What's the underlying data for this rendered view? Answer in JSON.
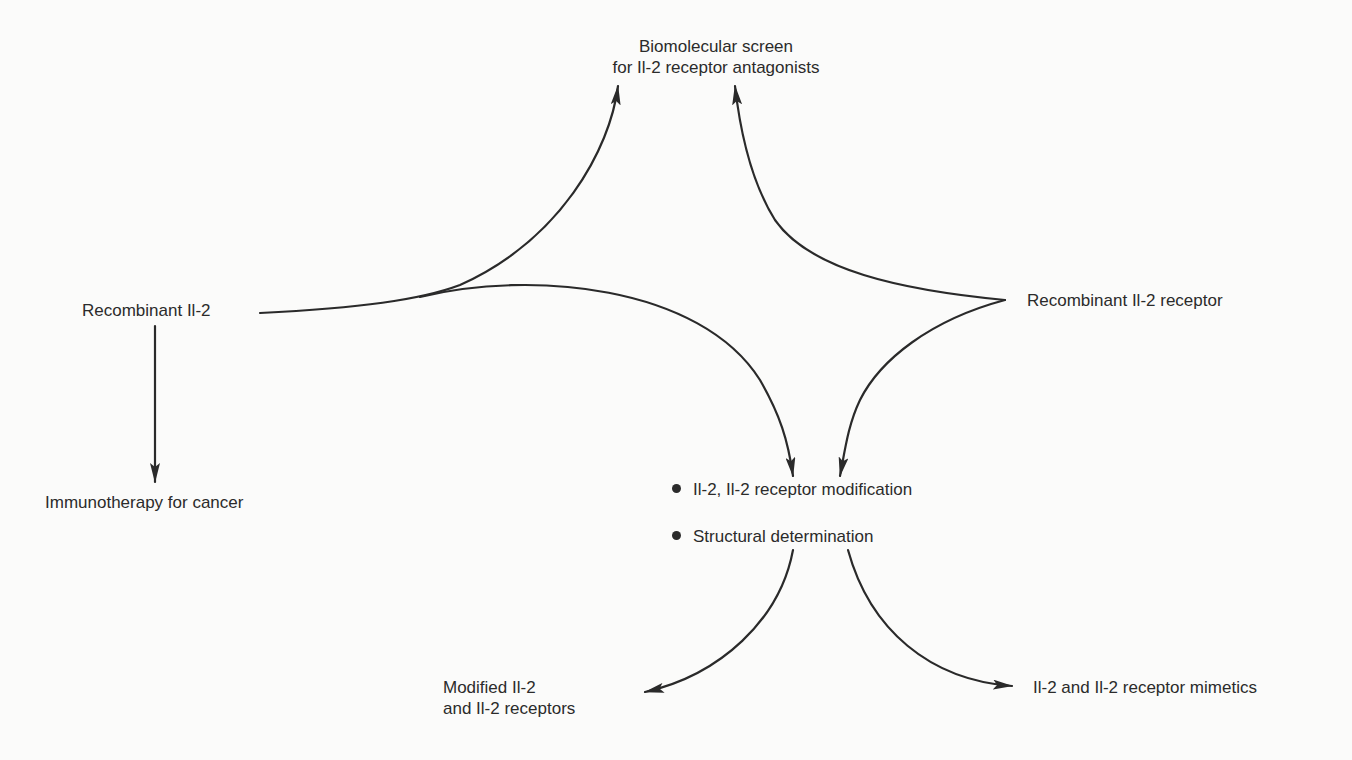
{
  "diagram": {
    "type": "flow-diagram",
    "stroke_color": "#2a2a2a",
    "background": "#fbfbfa",
    "nodes": {
      "biomolecular_screen": {
        "line1": "Biomolecular screen",
        "line2": "for Il-2 receptor antagonists"
      },
      "recombinant_il2": {
        "label": "Recombinant Il-2"
      },
      "recombinant_il2_receptor": {
        "label": "Recombinant Il-2 receptor"
      },
      "immunotherapy": {
        "label": "Immunotherapy for cancer"
      },
      "modification_hub": {
        "items": [
          "Il-2, Il-2 receptor modification",
          "Structural determination"
        ]
      },
      "modified_il2": {
        "line1": "Modified Il-2",
        "line2": "and Il-2 receptors"
      },
      "mimetics": {
        "label": "Il-2 and Il-2 receptor mimetics"
      }
    },
    "edges": [
      {
        "from": "Recombinant Il-2",
        "to": "Biomolecular screen for Il-2 receptor antagonists"
      },
      {
        "from": "Recombinant Il-2",
        "to": "Il-2, Il-2 receptor modification / Structural determination"
      },
      {
        "from": "Recombinant Il-2",
        "to": "Immunotherapy for cancer"
      },
      {
        "from": "Recombinant Il-2 receptor",
        "to": "Biomolecular screen for Il-2 receptor antagonists"
      },
      {
        "from": "Recombinant Il-2 receptor",
        "to": "Il-2, Il-2 receptor modification / Structural determination"
      },
      {
        "from": "Il-2, Il-2 receptor modification / Structural determination",
        "to": "Modified Il-2 and Il-2 receptors"
      },
      {
        "from": "Il-2, Il-2 receptor modification / Structural determination",
        "to": "Il-2 and Il-2 receptor mimetics"
      }
    ]
  }
}
